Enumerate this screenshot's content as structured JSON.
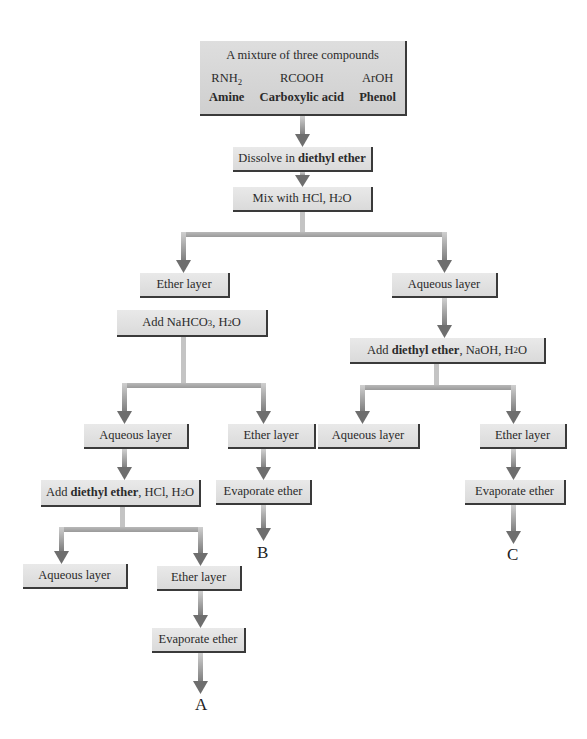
{
  "mixture": {
    "title": "A mixture of three compounds",
    "compounds": [
      {
        "formula_main": "RNH",
        "formula_sub": "2",
        "name": "Amine"
      },
      {
        "formula_main": "RCOOH",
        "formula_sub": "",
        "name": "Carboxylic acid"
      },
      {
        "formula_main": "ArOH",
        "formula_sub": "",
        "name": "Phenol"
      }
    ]
  },
  "steps": {
    "dissolve": {
      "pre": "Dissolve in ",
      "bold": "diethyl ether"
    },
    "mix": {
      "pre": "Mix with HCl, H",
      "sub": "2",
      "post": "O"
    },
    "ether_layer_1": "Ether layer",
    "aqueous_layer_1": "Aqueous layer",
    "add_nahco3": {
      "pre": "Add NaHCO",
      "sub1": "3",
      "mid": ", H",
      "sub2": "2",
      "post": "O"
    },
    "add_ether_naoh": {
      "pre": "Add ",
      "bold": "diethyl ether",
      "mid": ", NaOH, H",
      "sub": "2",
      "post": "O"
    },
    "aqueous_layer_2": "Aqueous layer",
    "ether_layer_2": "Ether layer",
    "aqueous_layer_3": "Aqueous layer",
    "ether_layer_3": "Ether layer",
    "add_ether_hcl": {
      "pre": "Add ",
      "bold": "diethyl ether",
      "mid": ", HCl, H",
      "sub": "2",
      "post": "O"
    },
    "evaporate_b": "Evaporate ether",
    "evaporate_c": "Evaporate ether",
    "aqueous_layer_4": "Aqueous layer",
    "ether_layer_4": "Ether layer",
    "evaporate_a": "Evaporate ether"
  },
  "results": {
    "a": "A",
    "b": "B",
    "c": "C"
  },
  "colors": {
    "box_fill": "#dedede",
    "box_shadow": "#3a3a3a",
    "arrow_light": "#c8c8c8",
    "arrow_dark": "#707070"
  }
}
